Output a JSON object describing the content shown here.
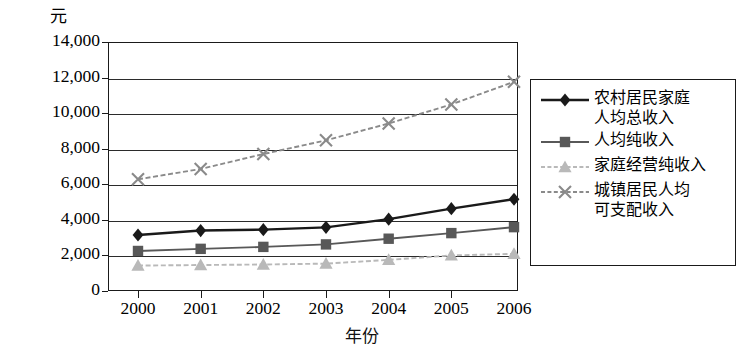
{
  "chart_data": {
    "type": "line",
    "title": "",
    "subtitle": "",
    "xlabel": "年份",
    "ylabel": "元",
    "unit_label": "元",
    "categories": [
      "2000",
      "2001",
      "2002",
      "2003",
      "2004",
      "2005",
      "2006"
    ],
    "x": [
      2000,
      2001,
      2002,
      2003,
      2004,
      2005,
      2006
    ],
    "ylim": [
      0,
      14000
    ],
    "ytick_values": [
      0,
      2000,
      4000,
      6000,
      8000,
      10000,
      12000,
      14000
    ],
    "ytick_labels": [
      "0",
      "2,000",
      "4,000",
      "6,000",
      "8,000",
      "10,000",
      "12,000",
      "14,000"
    ],
    "grid": true,
    "grid_axis": "y",
    "legend_position": "right",
    "series": [
      {
        "name": "农村居民家庭人均总收入",
        "legend_label": "农村居民家庭\n人均总收入",
        "marker": "diamond",
        "color": "#1a1a1a",
        "line_style": "solid",
        "values": [
          3150,
          3400,
          3450,
          3580,
          4040,
          4630,
          5160
        ]
      },
      {
        "name": "人均纯收入",
        "legend_label": "人均纯收入",
        "marker": "square",
        "color": "#585858",
        "line_style": "solid",
        "values": [
          2250,
          2370,
          2480,
          2620,
          2940,
          3255,
          3590
        ]
      },
      {
        "name": "家庭经营纯收入",
        "legend_label": "家庭经营纯收入",
        "marker": "triangle",
        "color": "#b9b9b9",
        "line_style": "dashed",
        "values": [
          1430,
          1460,
          1490,
          1540,
          1750,
          2000,
          2090
        ]
      },
      {
        "name": "城镇居民人均可支配收入",
        "legend_label": "城镇居民人均\n可支配收入",
        "marker": "cross",
        "color": "#8a8a8a",
        "line_style": "dashed",
        "values": [
          6280,
          6860,
          7700,
          8470,
          9420,
          10490,
          11760
        ]
      }
    ]
  },
  "plot": {
    "frame_color": "#1a1a1a",
    "background": "#ffffff"
  }
}
